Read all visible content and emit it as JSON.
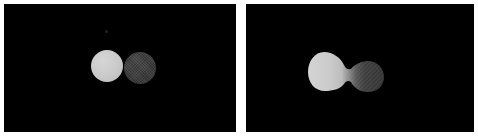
{
  "figure": {
    "background": "#ffffff",
    "panel_background": "#000000",
    "divider_color": "#f2f2f2",
    "caption": ""
  },
  "panels": [
    {
      "id": "panel-left",
      "state_label": "",
      "x": 4,
      "y": 4,
      "width": 232,
      "height": 128,
      "objects": [
        {
          "name": "light-blob",
          "shape": "circle",
          "cx": 103,
          "cy": 62,
          "r": 16,
          "fill": "#c9c9c9",
          "texture": "smooth"
        },
        {
          "name": "dark-blob",
          "shape": "circle",
          "cx": 136,
          "cy": 64,
          "r": 16,
          "fill": "#3b3b3b",
          "texture": "cross-hatch-dither"
        },
        {
          "name": "faint-speck",
          "shape": "dot",
          "cx": 103,
          "cy": 28,
          "r": 2,
          "fill": "#232323",
          "texture": "smooth"
        }
      ]
    },
    {
      "id": "panel-right",
      "state_label": "",
      "x": 246,
      "y": 4,
      "width": 228,
      "height": 128,
      "objects": [
        {
          "name": "merged-peanut-blob",
          "shape": "peanut",
          "left_lobe": {
            "cx": 78,
            "cy": 62,
            "r": 17,
            "fill": "#c9c9c9",
            "texture": "smooth"
          },
          "right_lobe": {
            "cx": 118,
            "cy": 64,
            "r": 17,
            "fill": "#3b3b3b",
            "texture": "cross-hatch-dither"
          },
          "neck_width": 22,
          "gradient": "light-to-dark"
        }
      ]
    }
  ],
  "colors": {
    "light_gray": "#c9c9c9",
    "dark_gray": "#3b3b3b",
    "black": "#000000",
    "white": "#ffffff",
    "speck": "#232323"
  }
}
